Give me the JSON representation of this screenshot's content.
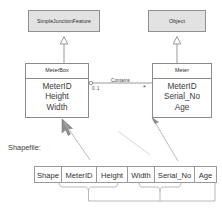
{
  "diagram": {
    "title_label": "Shapefile:",
    "classes": [
      {
        "id": "simple-junction-feature",
        "name": "SimpleJunctionFeature",
        "kind": "abstract-super",
        "attributes": []
      },
      {
        "id": "object",
        "name": "Object",
        "kind": "abstract-super",
        "attributes": []
      },
      {
        "id": "meterbox",
        "name": "MeterBox",
        "kind": "concrete",
        "attributes": [
          "MeterID",
          "Height",
          "Width"
        ]
      },
      {
        "id": "meter",
        "name": "Meter",
        "kind": "concrete",
        "attributes": [
          "MeterID",
          "Serial_No",
          "Age"
        ]
      }
    ],
    "association": {
      "name": "Contains",
      "source_multiplicity": "0..1",
      "target_multiplicity": "*"
    },
    "generalizations": [
      {
        "from": "MeterBox",
        "to": "SimpleJunctionFeature"
      },
      {
        "from": "Meter",
        "to": "Object"
      }
    ],
    "shapefile_table": {
      "columns": [
        "Shape",
        "MeterID",
        "Height",
        "Width",
        "Serial_No",
        "Age"
      ],
      "group_meterbox": [
        "MeterID",
        "Height",
        "Width"
      ],
      "group_meter": [
        "Serial_No",
        "Age"
      ]
    },
    "colors": {
      "superclass_fill": "#e2e2e2",
      "box_stroke": "#8a8a8a",
      "line": "#9a9a9a",
      "text": "#2f2f2f"
    }
  }
}
